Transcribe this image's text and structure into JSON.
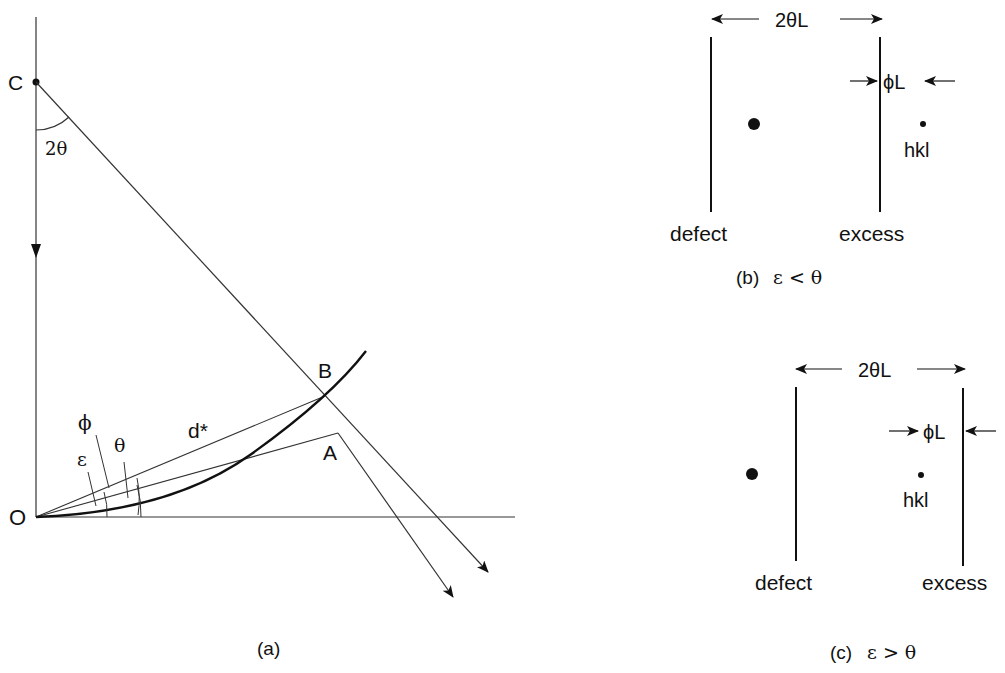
{
  "figure": {
    "panel_a": {
      "caption": "(a)",
      "points": {
        "C": "C",
        "O": "O",
        "A": "A",
        "B": "B"
      },
      "angle_labels": {
        "two_theta": "2θ",
        "phi": "ϕ",
        "epsilon": "ε",
        "theta": "θ"
      },
      "vector_label": "d*"
    },
    "panel_b": {
      "width_label": "2θL",
      "phi_label": "ϕL",
      "spot_label": "hkl",
      "left_line_label": "defect",
      "right_line_label": "excess",
      "caption_prefix": "(b)",
      "caption_condition": "ε < θ"
    },
    "panel_c": {
      "width_label": "2θL",
      "phi_label": "ϕL",
      "spot_label": "hkl",
      "left_line_label": "defect",
      "right_line_label": "excess",
      "caption_prefix": "(c)",
      "caption_condition": "ε > θ"
    }
  }
}
